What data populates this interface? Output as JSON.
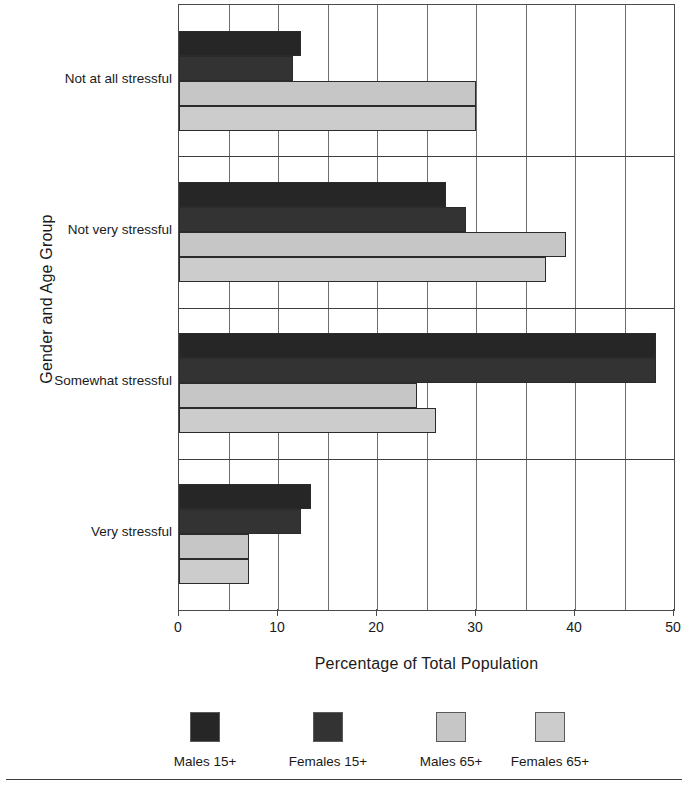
{
  "chart_data": {
    "type": "bar",
    "orientation": "horizontal",
    "title": "",
    "xlabel": "Percentage of Total Population",
    "ylabel": "Gender and Age Group",
    "xlim": [
      0,
      50
    ],
    "xticks": [
      0,
      10,
      20,
      30,
      40,
      50
    ],
    "xticklabels": [
      "0",
      "10",
      "20",
      "30",
      "40",
      "50"
    ],
    "minor_gridlines_every": 5,
    "grid": true,
    "legend_position": "bottom",
    "categories": [
      "Not at all stressful",
      "Not very stressful",
      "Somewhat stressful",
      "Very stressful"
    ],
    "series": [
      {
        "name": "Males 15+",
        "color": "#262626",
        "values": [
          12.3,
          27.0,
          48.2,
          13.3
        ]
      },
      {
        "name": "Females 15+",
        "color": "#333333",
        "values": [
          11.5,
          29.0,
          48.2,
          12.3
        ]
      },
      {
        "name": "Males 65+",
        "color": "#c6c6c6",
        "values": [
          30.0,
          39.1,
          24.0,
          7.1
        ]
      },
      {
        "name": "Females 65+",
        "color": "#cccccc",
        "values": [
          30.0,
          37.1,
          26.0,
          7.1
        ]
      }
    ]
  },
  "axis": {
    "ylabel": "Gender and Age Group",
    "xlabel": "Percentage of Total Population"
  }
}
